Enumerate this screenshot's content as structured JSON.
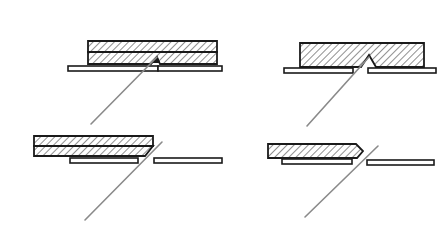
{
  "diagram": {
    "type": "technical-cross-section",
    "colors": {
      "background": "#ffffff",
      "line": "#1a1a1a",
      "rod": "#8a8a8a"
    },
    "panels": [
      {
        "id": "top-left",
        "board": {
          "layers": 2,
          "x": 88,
          "y": 41,
          "w": 129,
          "h": 23,
          "notch": "small wedge at bottom layer near joint"
        },
        "strip_left": {
          "x": 68,
          "y": 66,
          "w": 90,
          "h": 5
        },
        "strip_right": {
          "x": 158,
          "y": 66,
          "w": 64,
          "h": 5
        },
        "rod": {
          "x1": 91,
          "y1": 124,
          "x2": 157,
          "y2": 56
        }
      },
      {
        "id": "top-right",
        "board": {
          "layers": 1,
          "x": 300,
          "y": 43,
          "w": 124,
          "h": 24,
          "notch": "V-notch on bottom face"
        },
        "strip_left": {
          "x": 284,
          "y": 68,
          "w": 69,
          "h": 5
        },
        "strip_right": {
          "x": 368,
          "y": 68,
          "w": 68,
          "h": 5
        },
        "rod": {
          "x1": 307,
          "y1": 126,
          "x2": 370,
          "y2": 63
        }
      },
      {
        "id": "bottom-left",
        "board": {
          "layers": 2,
          "x": 34,
          "y": 136,
          "w": 119,
          "h": 20,
          "notch": "angled end"
        },
        "strip_left": {
          "x": 70,
          "y": 158,
          "w": 68,
          "h": 5
        },
        "strip_right": {
          "x": 154,
          "y": 158,
          "w": 68,
          "h": 5
        },
        "rod": {
          "x1": 85,
          "y1": 220,
          "x2": 162,
          "y2": 142
        }
      },
      {
        "id": "bottom-right",
        "board": {
          "layers": 1,
          "x": 268,
          "y": 144,
          "w": 94,
          "h": 14,
          "notch": "pointed chisel tip"
        },
        "strip_left": {
          "x": 282,
          "y": 159,
          "w": 70,
          "h": 5
        },
        "strip_right": {
          "x": 367,
          "y": 160,
          "w": 67,
          "h": 5
        },
        "rod": {
          "x1": 305,
          "y1": 217,
          "x2": 378,
          "y2": 146
        }
      }
    ]
  }
}
